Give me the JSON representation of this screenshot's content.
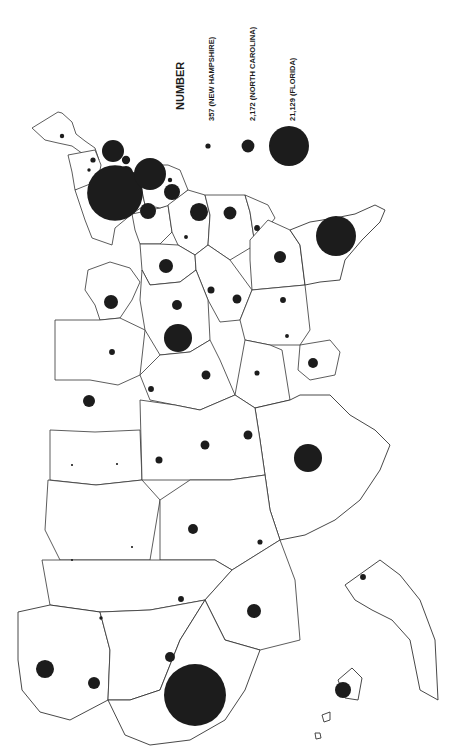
{
  "legend": {
    "title": "NUMBER",
    "entries": [
      {
        "label": "357 (NEW HAMPSHIRE)",
        "value": 357
      },
      {
        "label": "2,172 (NORTH CAROLINA)",
        "value": 2172
      },
      {
        "label": "21,129 (FLORIDA)",
        "value": 21129
      }
    ]
  },
  "map": {
    "orientation": "rotated 90 degrees counter-clockwise (north toward left edge)",
    "symbol": "proportional circle",
    "symbol_color": "#1c1c1c",
    "outline_color": "#333333",
    "states": [
      {
        "name": "Maine",
        "value": 250
      },
      {
        "name": "New Hampshire",
        "value": 357
      },
      {
        "name": "Vermont",
        "value": 150
      },
      {
        "name": "Massachusetts",
        "value": 6400
      },
      {
        "name": "Rhode Island",
        "value": 900
      },
      {
        "name": "Connecticut",
        "value": 2600
      },
      {
        "name": "New York",
        "value": 41000
      },
      {
        "name": "New Jersey",
        "value": 13500
      },
      {
        "name": "Delaware",
        "value": 250
      },
      {
        "name": "Maryland",
        "value": 3400
      },
      {
        "name": "Pennsylvania",
        "value": 3400
      },
      {
        "name": "Virginia",
        "value": 4300
      },
      {
        "name": "North Carolina",
        "value": 2172
      },
      {
        "name": "South Carolina",
        "value": 450
      },
      {
        "name": "Georgia",
        "value": 1900
      },
      {
        "name": "Florida",
        "value": 21129
      },
      {
        "name": "West Virginia",
        "value": 200
      },
      {
        "name": "Ohio",
        "value": 2600
      },
      {
        "name": "Kentucky",
        "value": 650
      },
      {
        "name": "Tennessee",
        "value": 1050
      },
      {
        "name": "Alabama",
        "value": 450
      },
      {
        "name": "Mississippi",
        "value": 200
      },
      {
        "name": "Louisiana",
        "value": 1300
      },
      {
        "name": "Michigan",
        "value": 2600
      },
      {
        "name": "Indiana",
        "value": 1300
      },
      {
        "name": "Illinois",
        "value": 10400
      },
      {
        "name": "Wisconsin",
        "value": 450
      },
      {
        "name": "Minnesota",
        "value": 1900
      },
      {
        "name": "Iowa",
        "value": 450
      },
      {
        "name": "Missouri",
        "value": 1050
      },
      {
        "name": "Arkansas",
        "value": 350
      },
      {
        "name": "Texas",
        "value": 10400
      },
      {
        "name": "North Dakota",
        "value": 60
      },
      {
        "name": "South Dakota",
        "value": 60
      },
      {
        "name": "Nebraska",
        "value": 650
      },
      {
        "name": "Kansas",
        "value": 1050
      },
      {
        "name": "Oklahoma",
        "value": 1050
      },
      {
        "name": "Montana",
        "value": 60
      },
      {
        "name": "Wyoming",
        "value": 60
      },
      {
        "name": "Colorado",
        "value": 1300
      },
      {
        "name": "New Mexico",
        "value": 350
      },
      {
        "name": "Idaho",
        "value": 150
      },
      {
        "name": "Utah",
        "value": 450
      },
      {
        "name": "Arizona",
        "value": 2600
      },
      {
        "name": "Washington",
        "value": 4300
      },
      {
        "name": "Oregon",
        "value": 1900
      },
      {
        "name": "Nevada",
        "value": 1300
      },
      {
        "name": "California",
        "value": 50700
      },
      {
        "name": "Alaska",
        "value": 450
      },
      {
        "name": "Hawaii",
        "value": 3400
      }
    ]
  }
}
